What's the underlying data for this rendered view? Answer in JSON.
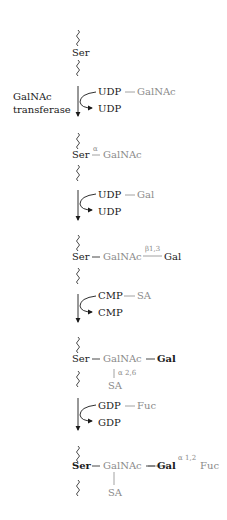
{
  "enzyme_label": [
    "GalNAc",
    "transferase"
  ],
  "colors": {
    "dark": "#1a1a1a",
    "gray": "#8a8a8a"
  },
  "steps": [
    {
      "structure": {
        "residue": "Ser"
      }
    },
    {
      "reaction": {
        "donor": "UDP",
        "sugar": "GalNAc",
        "product": "UDP"
      }
    },
    {
      "structure": {
        "residue": "Ser",
        "link": "α",
        "sugar1": "GalNAc"
      }
    },
    {
      "reaction": {
        "donor": "UDP",
        "sugar": "Gal",
        "product": "UDP"
      }
    },
    {
      "structure": {
        "residue": "Ser",
        "sugar1": "GalNAc",
        "link2": "β1,3",
        "sugar2": "Gal"
      }
    },
    {
      "reaction": {
        "donor": "CMP",
        "sugar": "SA",
        "product": "CMP"
      }
    },
    {
      "structure": {
        "residue": "Ser",
        "sugar1": "GalNAc",
        "sugar2": "Gal",
        "branch_link": "α 2,6",
        "branch": "SA"
      }
    },
    {
      "reaction": {
        "donor": "GDP",
        "sugar": "Fuc",
        "product": "GDP"
      }
    },
    {
      "structure": {
        "residue": "Ser",
        "sugar1": "GalNAc",
        "sugar2": "Gal",
        "link3": "α 1,2",
        "sugar3": "Fuc",
        "branch": "SA"
      }
    }
  ]
}
